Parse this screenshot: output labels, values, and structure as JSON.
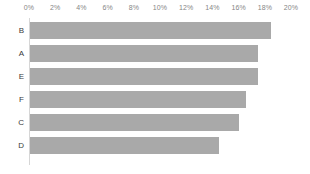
{
  "chart_data": {
    "type": "bar",
    "orientation": "horizontal",
    "title": "",
    "subtitle": "",
    "xlabel": "",
    "ylabel": "",
    "categories": [
      "B",
      "A",
      "E",
      "F",
      "C",
      "D"
    ],
    "values": [
      18.5,
      17.5,
      17.5,
      16.6,
      16.0,
      14.5
    ],
    "series": [
      {
        "name": "",
        "values": [
          18.5,
          17.5,
          17.5,
          16.6,
          16.0,
          14.5
        ]
      }
    ],
    "xlim": [
      0,
      20
    ],
    "ylim": null,
    "x_ticks": [
      0,
      2,
      4,
      6,
      8,
      10,
      12,
      14,
      16,
      18,
      20
    ],
    "x_tick_labels": [
      "0%",
      "2%",
      "4%",
      "6%",
      "8%",
      "10%",
      "12%",
      "14%",
      "16%",
      "18%",
      "20%"
    ],
    "x_axis_position": "top",
    "grid": false,
    "legend": false,
    "legend_position": "none",
    "annotations": [],
    "bar_color": "#a9a9a9",
    "axis_line_color": "#d6d6d6",
    "tick_label_color": "#868686",
    "category_label_color": "#3a3a3a",
    "background_color": "#ffffff"
  },
  "axis": {
    "ticks": [
      {
        "label": "0%",
        "value": 0
      },
      {
        "label": "2%",
        "value": 2
      },
      {
        "label": "4%",
        "value": 4
      },
      {
        "label": "6%",
        "value": 6
      },
      {
        "label": "8%",
        "value": 8
      },
      {
        "label": "10%",
        "value": 10
      },
      {
        "label": "12%",
        "value": 12
      },
      {
        "label": "14%",
        "value": 14
      },
      {
        "label": "16%",
        "value": 16
      },
      {
        "label": "18%",
        "value": 18
      },
      {
        "label": "20%",
        "value": 20
      }
    ]
  },
  "bars": [
    {
      "category": "B",
      "value": 18.5
    },
    {
      "category": "A",
      "value": 17.5
    },
    {
      "category": "E",
      "value": 17.5
    },
    {
      "category": "F",
      "value": 16.6
    },
    {
      "category": "C",
      "value": 16.0
    },
    {
      "category": "D",
      "value": 14.5
    }
  ],
  "layout": {
    "plot_left_px": 29,
    "plot_right_px": 291,
    "row_height_px": 23,
    "bar_height_px": 17,
    "first_row_top_px": 4
  }
}
